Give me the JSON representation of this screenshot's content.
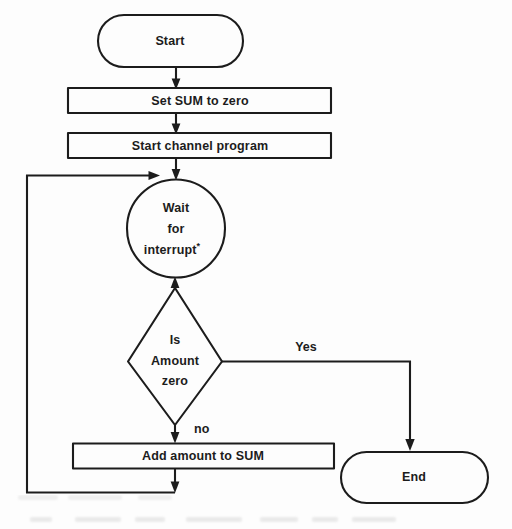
{
  "diagram": {
    "type": "flowchart",
    "background_color": "#fdfdfd",
    "line_color": "#1c1c1c",
    "nodes": [
      {
        "id": "start",
        "shape": "terminator",
        "label": "Start",
        "x": 170,
        "y": 41
      },
      {
        "id": "set-sum",
        "shape": "process",
        "label": "Set SUM to zero",
        "x": 200,
        "y": 101
      },
      {
        "id": "start-channel",
        "shape": "process",
        "label": "Start channel program",
        "x": 200,
        "y": 146
      },
      {
        "id": "wait",
        "shape": "circle",
        "label_line1": "Wait",
        "label_line2": "for",
        "label_line3": "interrupt",
        "footnote_mark": "*",
        "x": 176,
        "y": 228
      },
      {
        "id": "decision",
        "shape": "diamond",
        "label_line1": "Is",
        "label_line2": "Amount",
        "label_line3": "zero",
        "x": 175,
        "y": 361
      },
      {
        "id": "add-amount",
        "shape": "process",
        "label": "Add amount to SUM",
        "x": 203,
        "y": 456
      },
      {
        "id": "end",
        "shape": "terminator",
        "label": "End",
        "x": 414,
        "y": 477
      }
    ],
    "edges": [
      {
        "id": "start-to-setsum",
        "from": "start",
        "to": "set-sum",
        "label": ""
      },
      {
        "id": "setsum-to-channel",
        "from": "set-sum",
        "to": "start-channel",
        "label": ""
      },
      {
        "id": "channel-to-wait",
        "from": "start-channel",
        "to": "wait",
        "label": ""
      },
      {
        "id": "wait-to-decision",
        "from": "wait",
        "to": "decision",
        "label": ""
      },
      {
        "id": "decision-yes-to-end",
        "from": "decision",
        "to": "end",
        "label": "Yes"
      },
      {
        "id": "decision-no-to-add",
        "from": "decision",
        "to": "add-amount",
        "label": "no"
      },
      {
        "id": "add-to-wait-loop",
        "from": "add-amount",
        "to": "wait",
        "label": ""
      }
    ],
    "edge_labels": {
      "yes": "Yes",
      "no": "no"
    }
  }
}
